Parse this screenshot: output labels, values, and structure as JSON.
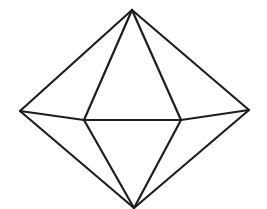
{
  "figure": {
    "shape": "octahedron",
    "stroke_color": "#1e1e1e",
    "stroke_width": 2.2,
    "background": "#ffffff",
    "vertices": {
      "top": [
        132,
        10
      ],
      "left": [
        20,
        111
      ],
      "right": [
        249,
        110
      ],
      "front_left": [
        84,
        120
      ],
      "front_right": [
        181,
        120
      ],
      "bottom": [
        134,
        208
      ]
    },
    "edges": [
      [
        "top",
        "left"
      ],
      [
        "top",
        "right"
      ],
      [
        "top",
        "front_left"
      ],
      [
        "top",
        "front_right"
      ],
      [
        "left",
        "front_left"
      ],
      [
        "front_left",
        "front_right"
      ],
      [
        "front_right",
        "right"
      ],
      [
        "left",
        "bottom"
      ],
      [
        "right",
        "bottom"
      ],
      [
        "front_left",
        "bottom"
      ],
      [
        "front_right",
        "bottom"
      ]
    ]
  }
}
